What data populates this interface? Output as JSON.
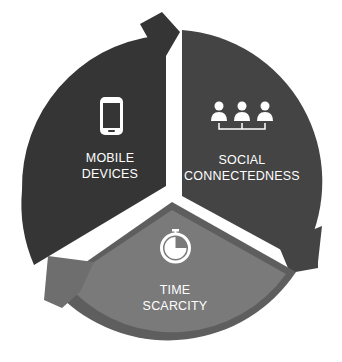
{
  "diagram": {
    "type": "cycle",
    "segments": [
      {
        "id": "mobile",
        "line1": "MOBILE",
        "line2": "DEVICES",
        "icon": "smartphone-icon",
        "color": "#353535"
      },
      {
        "id": "social",
        "line1": "SOCIAL",
        "line2": "CONNECTEDNESS",
        "icon": "people-network-icon",
        "color": "#444444"
      },
      {
        "id": "time",
        "line1": "TIME",
        "line2": "SCARCITY",
        "icon": "stopwatch-icon",
        "color": "#7a7a7a",
        "ring_color": "#5e5e5e"
      }
    ],
    "background": "#ffffff",
    "icon_color": "#ffffff"
  }
}
